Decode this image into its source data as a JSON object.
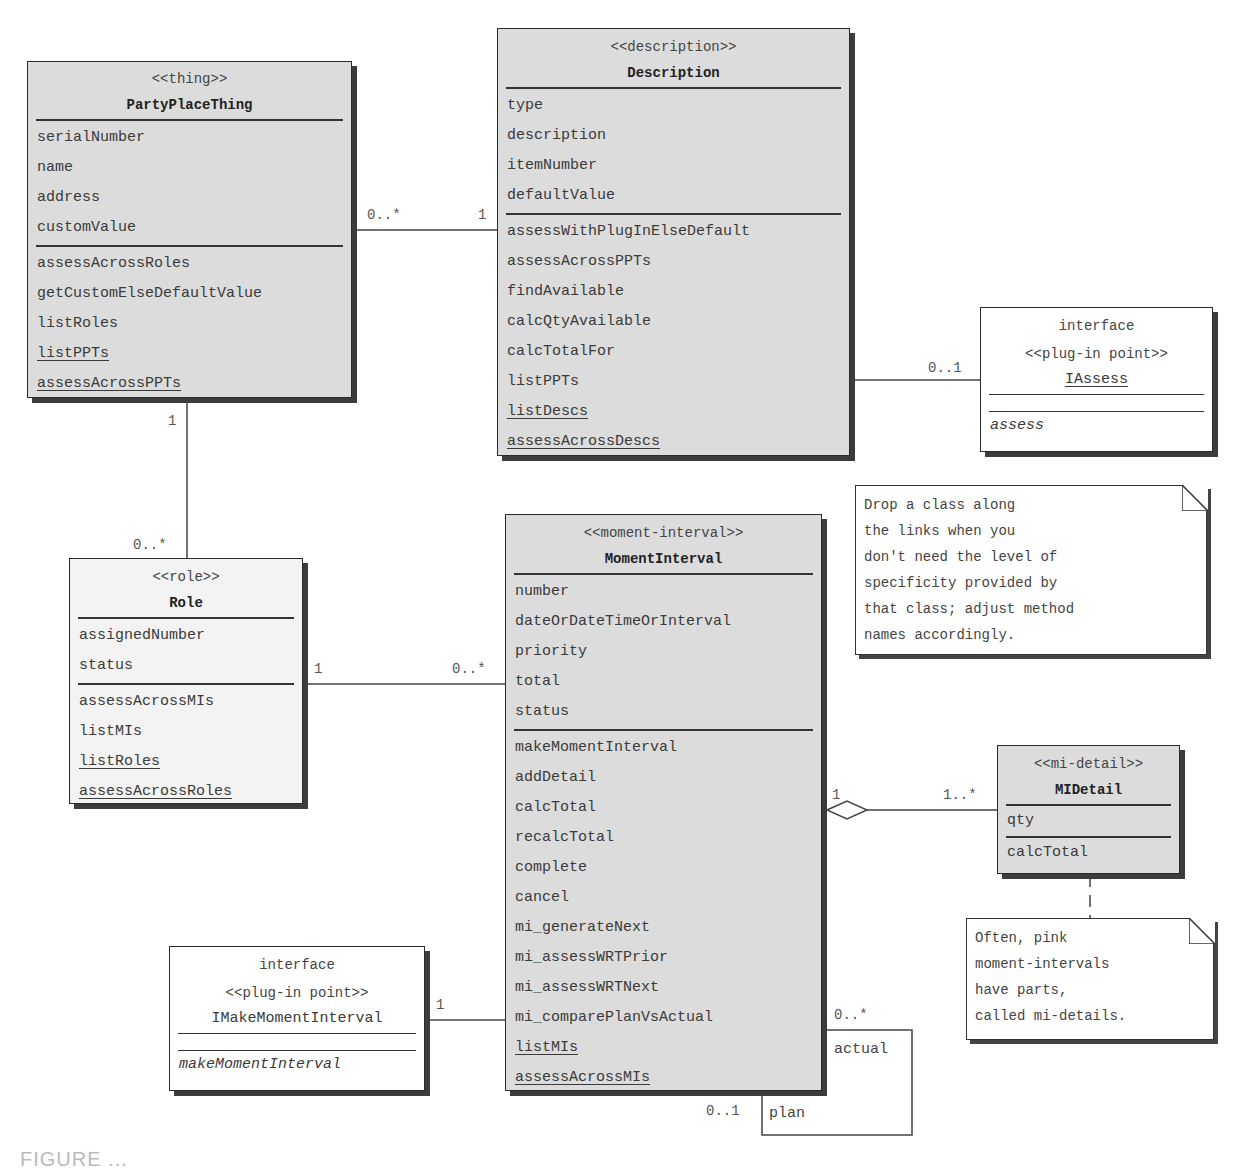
{
  "classes": {
    "ppt": {
      "stereotype": "<<thing>>",
      "name": "PartyPlaceThing",
      "attributes": [
        "serialNumber",
        "name",
        "address",
        "customValue"
      ],
      "methods": [
        "assessAcrossRoles",
        "getCustomElseDefaultValue",
        "listRoles",
        "listPPTs",
        "assessAcrossPPTs"
      ],
      "static_methods": [
        "listPPTs",
        "assessAcrossPPTs"
      ],
      "fill": "#dcdcdc"
    },
    "description": {
      "stereotype": "<<description>>",
      "name": "Description",
      "attributes": [
        "type",
        "description",
        "itemNumber",
        "defaultValue"
      ],
      "methods": [
        "assessWithPlugInElseDefault",
        "assessAcrossPPTs",
        "findAvailable",
        "calcQtyAvailable",
        "calcTotalFor",
        "listPPTs",
        "listDescs",
        "assessAcrossDescs"
      ],
      "static_methods": [
        "listDescs",
        "assessAcrossDescs"
      ],
      "fill": "#dcdcdc"
    },
    "role": {
      "stereotype": "<<role>>",
      "name": "Role",
      "attributes": [
        "assignedNumber",
        "status"
      ],
      "methods": [
        "assessAcrossMIs",
        "listMIs",
        "listRoles",
        "assessAcrossRoles"
      ],
      "static_methods": [
        "listRoles",
        "assessAcrossRoles"
      ],
      "fill": "#f3f3f3"
    },
    "moment_interval": {
      "stereotype": "<<moment-interval>>",
      "name": "MomentInterval",
      "attributes": [
        "number",
        "dateOrDateTimeOrInterval",
        "priority",
        "total",
        "status"
      ],
      "methods": [
        "makeMomentInterval",
        "addDetail",
        "calcTotal",
        "recalcTotal",
        "complete",
        "cancel",
        "mi_generateNext",
        "mi_assessWRTPrior",
        "mi_assessWRTNext",
        "mi_comparePlanVsActual",
        "listMIs",
        "assessAcrossMIs"
      ],
      "static_methods": [
        "listMIs",
        "assessAcrossMIs"
      ],
      "fill": "#dcdcdc"
    },
    "mi_detail": {
      "stereotype": "<<mi-detail>>",
      "name": "MIDetail",
      "attributes": [
        "qty"
      ],
      "methods": [
        "calcTotal"
      ],
      "fill": "#dcdcdc"
    }
  },
  "interfaces": {
    "iassess": {
      "kind": "interface",
      "stereotype": "<<plug-in point>>",
      "name": "IAssess",
      "methods": [
        "assess"
      ]
    },
    "imake": {
      "kind": "interface",
      "stereotype": "<<plug-in point>>",
      "name": "IMakeMomentInterval",
      "methods": [
        "makeMomentInterval"
      ]
    }
  },
  "notes": {
    "drop_class": [
      "Drop a class along",
      "the links when you",
      "don't need the level of",
      "specificity provided by",
      "that class; adjust method",
      "names accordingly."
    ],
    "pink_mi": [
      "Often, pink",
      "moment-intervals",
      "have parts,",
      "called mi-details."
    ]
  },
  "associations": {
    "ppt_description": {
      "ppt_end": "0..*",
      "desc_end": "1"
    },
    "ppt_role": {
      "ppt_end": "1",
      "role_end": "0..*"
    },
    "description_iassess": {
      "iassess_end": "0..1"
    },
    "role_mi": {
      "role_end": "1",
      "mi_end": "0..*"
    },
    "mi_detail": {
      "mi_end": "1",
      "detail_end": "1..*",
      "type": "aggregation"
    },
    "imake_mi": {
      "imake_end": "1"
    },
    "mi_self": {
      "actual_mult": "0..*",
      "actual_role": "actual",
      "plan_mult": "0..1",
      "plan_role": "plan"
    }
  },
  "colors": {
    "class_fill": "#dcdcdc",
    "role_fill": "#f3f3f3",
    "border": "#2a2a2a",
    "shadow": "#3c3c3c"
  },
  "caption": "FIGURE ..."
}
